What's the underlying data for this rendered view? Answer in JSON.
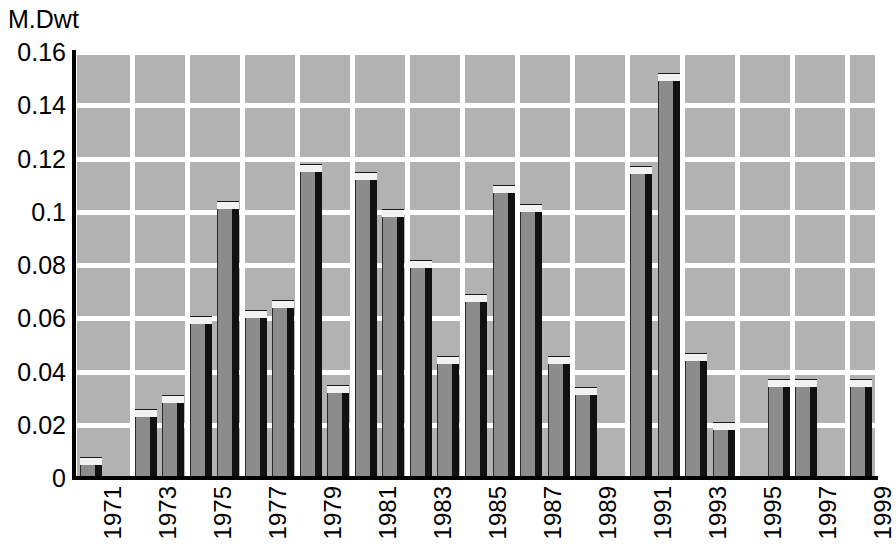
{
  "chart_data": {
    "type": "bar",
    "title": "",
    "subtitle": "",
    "ylabel": "M.Dwt",
    "xlabel": "",
    "ylim": [
      0,
      0.16
    ],
    "y_ticks": [
      "0",
      "0.02",
      "0.04",
      "0.06",
      "0.08",
      "0.1",
      "0.12",
      "0.14",
      "0.16"
    ],
    "y_tick_values": [
      0,
      0.02,
      0.04,
      0.06,
      0.08,
      0.1,
      0.12,
      0.14,
      0.16
    ],
    "x_tick_labels": [
      "1971",
      "1973",
      "1975",
      "1977",
      "1979",
      "1981",
      "1983",
      "1985",
      "1987",
      "1989",
      "1991",
      "1993",
      "1995",
      "1997",
      "1999"
    ],
    "grid": true,
    "grid_color": "#ffffff",
    "plot_background": "#b2b2b2",
    "bar_face_color": "#8c8c8c",
    "bar_top_color": "#f2f2f2",
    "bar_side_color": "#111111",
    "legend": null,
    "legend_position": "none",
    "categories": [
      "1971",
      "1972",
      "1973",
      "1974",
      "1975",
      "1976",
      "1977",
      "1978",
      "1979",
      "1980",
      "1981",
      "1982",
      "1983",
      "1984",
      "1985",
      "1986",
      "1987",
      "1988",
      "1989",
      "1990",
      "1991",
      "1992",
      "1993",
      "1994",
      "1995",
      "1996",
      "1997",
      "1998",
      "1999"
    ],
    "values": [
      0.005,
      0,
      0.023,
      0.028,
      0.058,
      0.101,
      0.06,
      0.064,
      0.115,
      0.032,
      0.112,
      0.098,
      0.079,
      0.043,
      0.066,
      0.107,
      0.1,
      0.043,
      0.031,
      0,
      0.114,
      0.149,
      0.044,
      0.018,
      0,
      0.034,
      0.034,
      0,
      0.034
    ]
  }
}
